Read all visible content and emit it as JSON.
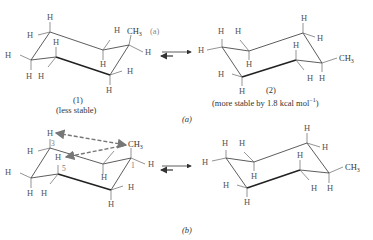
{
  "panel_a": {
    "caption": "(a)",
    "structure_1": {
      "number": "(1)",
      "stability": "(less stable)",
      "substituent": "CH3",
      "substituent_position": "(a)",
      "hydrogen_label": "H"
    },
    "structure_2": {
      "number": "(2)",
      "stability": "(more stable by 1.8 kcal mol",
      "stability_superscript": "−1",
      "stability_close": ")",
      "substituent": "CH3",
      "hydrogen_label": "H"
    },
    "equilibrium_icon": "equilibrium-arrows"
  },
  "panel_b": {
    "caption": "(b)",
    "left_structure": {
      "substituent": "CH3",
      "carbon_numbers": [
        "1",
        "3",
        "5"
      ],
      "interaction_arrows": "1,3-diaxial-interactions",
      "hydrogen_label": "H"
    },
    "right_structure": {
      "substituent": "CH3",
      "hydrogen_label": "H"
    },
    "equilibrium_icon": "equilibrium-arrows"
  },
  "colors": {
    "text": "#333333",
    "bonds": "#333333",
    "dashed_arrows": "#777777",
    "label_gray": "#888888"
  }
}
